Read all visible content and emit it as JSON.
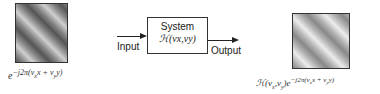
{
  "input_image": {
    "label": "e^{−j2π(ν_x x + ν_y y)}",
    "label_text": "e−j2π(νxx + νyy)"
  },
  "system": {
    "title": "System",
    "transfer": "ℋ(νx,νy)"
  },
  "arrows": {
    "input_label": "Input",
    "output_label": "Output"
  },
  "output_image": {
    "label_text": "ℋ(νx,νy)e−j2π(νxx + νyy)"
  }
}
